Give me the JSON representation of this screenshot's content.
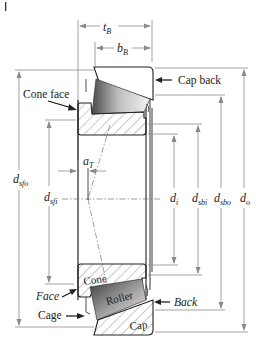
{
  "figure": {
    "colors": {
      "outline": "#222222",
      "dimension_lines": "#8a8a8a",
      "roller_dark": "#3a3a3a",
      "roller_light": "#f2f2f2"
    },
    "components": {
      "cone": "Cone",
      "roller": "Roller",
      "cap": "Cap"
    },
    "callouts": {
      "cap_back": "Cap back",
      "cone_face": "Cone face",
      "face": "Face",
      "back": "Back",
      "cage": "Cage"
    },
    "dimensions": {
      "t_B": {
        "sym": "t",
        "sub": "B"
      },
      "b_B": {
        "sym": "b",
        "sub": "B"
      },
      "a_T": {
        "sym": "a",
        "sub": "T"
      },
      "d_sfo": {
        "sym": "d",
        "sub": "sfo"
      },
      "d_sfi": {
        "sym": "d",
        "sub": "sfi"
      },
      "d_i": {
        "sym": "d",
        "sub": "i"
      },
      "d_sbi": {
        "sym": "d",
        "sub": "sbi"
      },
      "d_sbo": {
        "sym": "d",
        "sub": "sbo"
      },
      "d_o": {
        "sym": "d",
        "sub": "o"
      }
    }
  }
}
